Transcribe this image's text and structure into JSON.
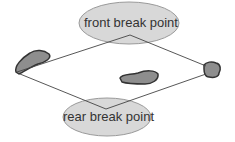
{
  "diagram": {
    "labels": {
      "front": "front break point",
      "rear": "rear break point"
    },
    "colors": {
      "ellipse_fill": "#d8d8d8",
      "ellipse_stroke": "#9a9a9a",
      "blob_fill": "#8e8e8e",
      "blob_stroke": "#333333",
      "line": "#444444"
    }
  }
}
